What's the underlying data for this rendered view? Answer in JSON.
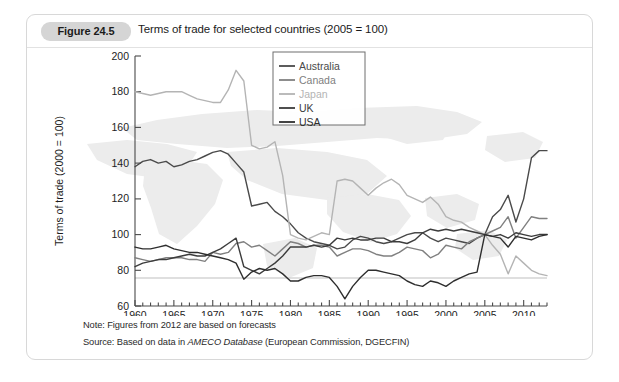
{
  "figure": {
    "badge": "Figure 24.5",
    "title": "Terms of trade for selected countries (2005 = 100)",
    "note": "Note: Figures from 2012 are based on forecasts",
    "source_prefix": "Source: Based on data in ",
    "source_italic": "AMECO Database",
    "source_suffix": " (European Commission, DGECFIN)"
  },
  "chart_data": {
    "type": "line",
    "title": "Terms of trade for selected countries (2005 = 100)",
    "xlabel": "",
    "ylabel": "Terms of trade (2000 = 100)",
    "xlim": [
      1960,
      2013
    ],
    "ylim": [
      60,
      200
    ],
    "ytick_step": 20,
    "yticks": [
      60,
      80,
      100,
      120,
      140,
      160,
      180,
      200
    ],
    "xticks": [
      1960,
      1965,
      1970,
      1975,
      1980,
      1985,
      1990,
      1995,
      2000,
      2005,
      2010
    ],
    "x_minor_tick_step": 1,
    "grid": false,
    "reference_line_y": 100,
    "legend_position": "top-right",
    "x": [
      1960,
      1961,
      1962,
      1963,
      1964,
      1965,
      1966,
      1967,
      1968,
      1969,
      1970,
      1971,
      1972,
      1973,
      1974,
      1975,
      1976,
      1977,
      1978,
      1979,
      1980,
      1981,
      1982,
      1983,
      1984,
      1985,
      1986,
      1987,
      1988,
      1989,
      1990,
      1991,
      1992,
      1993,
      1994,
      1995,
      1996,
      1997,
      1998,
      1999,
      2000,
      2001,
      2002,
      2003,
      2004,
      2005,
      2006,
      2007,
      2008,
      2009,
      2010,
      2011,
      2012,
      2013
    ],
    "series": [
      {
        "name": "Australia",
        "color": "#4a4a4a",
        "values": [
          138,
          141,
          142,
          140,
          141,
          138,
          139,
          141,
          142,
          144,
          146,
          147,
          145,
          140,
          135,
          116,
          117,
          118,
          113,
          110,
          106,
          101,
          98,
          96,
          95,
          94,
          92,
          93,
          97,
          99,
          98,
          96,
          95,
          96,
          98,
          100,
          101,
          101,
          98,
          96,
          98,
          97,
          96,
          95,
          98,
          100,
          110,
          114,
          122,
          107,
          120,
          143,
          147,
          147
        ]
      },
      {
        "name": "Canada",
        "color": "#808080",
        "values": [
          87,
          86,
          85,
          86,
          87,
          87,
          87,
          86,
          86,
          85,
          90,
          89,
          90,
          95,
          96,
          93,
          94,
          91,
          88,
          92,
          96,
          95,
          93,
          94,
          94,
          93,
          88,
          90,
          92,
          92,
          91,
          89,
          88,
          88,
          90,
          93,
          92,
          91,
          87,
          89,
          94,
          93,
          92,
          96,
          98,
          100,
          102,
          104,
          110,
          98,
          104,
          110,
          109,
          109
        ]
      },
      {
        "name": "Japan",
        "color": "#b4b4b4",
        "values": [
          180,
          179,
          178,
          179,
          180,
          180,
          180,
          178,
          176,
          175,
          174,
          174,
          181,
          192,
          186,
          150,
          148,
          149,
          152,
          133,
          100,
          98,
          97,
          99,
          101,
          100,
          130,
          131,
          130,
          126,
          122,
          126,
          129,
          131,
          128,
          122,
          120,
          118,
          121,
          117,
          110,
          108,
          107,
          104,
          102,
          100,
          94,
          89,
          78,
          88,
          84,
          80,
          78,
          77
        ]
      },
      {
        "name": "UK",
        "color": "#3c3c3c",
        "values": [
          82,
          84,
          85,
          86,
          86,
          87,
          88,
          89,
          88,
          88,
          90,
          92,
          95,
          98,
          82,
          80,
          78,
          81,
          84,
          88,
          93,
          93,
          93,
          94,
          93,
          94,
          98,
          97,
          98,
          97,
          97,
          98,
          98,
          96,
          96,
          95,
          97,
          101,
          103,
          102,
          103,
          102,
          103,
          102,
          101,
          100,
          99,
          100,
          98,
          101,
          100,
          99,
          100,
          100
        ]
      },
      {
        "name": "USA",
        "color": "#2e2e2e",
        "values": [
          93,
          92,
          92,
          93,
          94,
          92,
          91,
          90,
          90,
          89,
          88,
          87,
          86,
          84,
          75,
          79,
          81,
          80,
          81,
          78,
          74,
          74,
          76,
          77,
          77,
          76,
          71,
          64,
          71,
          76,
          80,
          80,
          79,
          78,
          77,
          74,
          72,
          71,
          74,
          73,
          71,
          74,
          76,
          78,
          79,
          100,
          99,
          98,
          93,
          99,
          98,
          97,
          99,
          100
        ]
      }
    ]
  },
  "legend": {
    "items": [
      {
        "label": "Australia",
        "color": "#4a4a4a"
      },
      {
        "label": "Canada",
        "color": "#808080"
      },
      {
        "label": "Japan",
        "color": "#b4b4b4"
      },
      {
        "label": "UK",
        "color": "#3c3c3c"
      },
      {
        "label": "USA",
        "color": "#2e2e2e"
      }
    ]
  }
}
